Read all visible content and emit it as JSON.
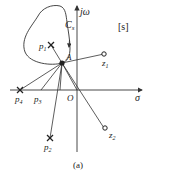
{
  "diagram": {
    "plane_label": "[s]",
    "caption": "(a)",
    "axes": {
      "imag_label": "jω",
      "real_label": "σ",
      "origin_label": "O"
    },
    "contour": {
      "label_main": "C",
      "label_sub": "s"
    },
    "point_A": {
      "label": "A"
    },
    "poles": [
      {
        "label_main": "p",
        "label_sub": "1"
      },
      {
        "label_main": "p",
        "label_sub": "2"
      },
      {
        "label_main": "p",
        "label_sub": "3"
      },
      {
        "label_main": "p",
        "label_sub": "4"
      }
    ],
    "zeros": [
      {
        "label_main": "z",
        "label_sub": "1"
      },
      {
        "label_main": "z",
        "label_sub": "2"
      }
    ],
    "colors": {
      "line": "#333333",
      "background": "#ffffff"
    }
  }
}
